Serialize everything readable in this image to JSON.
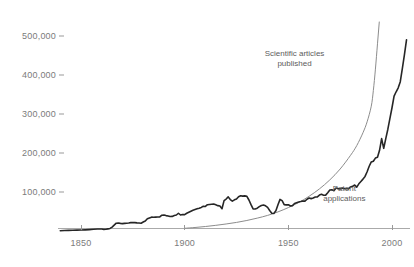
{
  "chart_data": {
    "type": "line",
    "title": "",
    "subtitle": "",
    "xlabel": "",
    "ylabel": "",
    "xlim": [
      1838,
      2008
    ],
    "ylim": [
      0,
      540000
    ],
    "grid": false,
    "legend_position": "inline-annotations",
    "y_ticks": [
      100000,
      200000,
      300000,
      400000,
      500000
    ],
    "y_tick_labels": [
      "100,000",
      "200,000",
      "300,000",
      "400,000",
      "500,000"
    ],
    "x_ticks": [
      1850,
      1900,
      1950,
      2000
    ],
    "x_tick_labels": [
      "1850",
      "1900",
      "1950",
      "2000"
    ],
    "series": [
      {
        "name": "Patent applications",
        "color": "#262626",
        "width": 1.6,
        "style": "jagged",
        "annotation": {
          "lines": [
            "Patent",
            "applications"
          ],
          "x": 1977,
          "y": 95000
        },
        "points": [
          [
            1840,
            800
          ],
          [
            1842,
            1100
          ],
          [
            1844,
            1500
          ],
          [
            1846,
            1800
          ],
          [
            1848,
            2200
          ],
          [
            1850,
            2500
          ],
          [
            1852,
            3000
          ],
          [
            1854,
            3600
          ],
          [
            1856,
            4400
          ],
          [
            1858,
            5200
          ],
          [
            1860,
            5000
          ],
          [
            1861,
            4200
          ],
          [
            1862,
            4500
          ],
          [
            1863,
            5500
          ],
          [
            1864,
            6600
          ],
          [
            1865,
            10000
          ],
          [
            1866,
            15000
          ],
          [
            1867,
            20000
          ],
          [
            1868,
            20500
          ],
          [
            1869,
            19500
          ],
          [
            1870,
            19000
          ],
          [
            1871,
            19500
          ],
          [
            1872,
            20000
          ],
          [
            1873,
            20500
          ],
          [
            1874,
            21500
          ],
          [
            1875,
            21800
          ],
          [
            1876,
            21400
          ],
          [
            1877,
            20800
          ],
          [
            1878,
            20500
          ],
          [
            1879,
            20000
          ],
          [
            1880,
            23000
          ],
          [
            1881,
            25500
          ],
          [
            1882,
            31500
          ],
          [
            1883,
            33500
          ],
          [
            1884,
            35500
          ],
          [
            1885,
            35200
          ],
          [
            1886,
            35500
          ],
          [
            1887,
            35800
          ],
          [
            1888,
            36000
          ],
          [
            1889,
            40500
          ],
          [
            1890,
            41000
          ],
          [
            1891,
            39500
          ],
          [
            1892,
            38500
          ],
          [
            1893,
            37000
          ],
          [
            1894,
            37500
          ],
          [
            1895,
            39500
          ],
          [
            1896,
            41000
          ],
          [
            1897,
            45500
          ],
          [
            1898,
            41000
          ],
          [
            1899,
            42500
          ],
          [
            1900,
            42000
          ],
          [
            1901,
            45500
          ],
          [
            1902,
            48000
          ],
          [
            1903,
            50500
          ],
          [
            1904,
            53000
          ],
          [
            1905,
            55000
          ],
          [
            1906,
            57000
          ],
          [
            1907,
            58500
          ],
          [
            1908,
            60500
          ],
          [
            1909,
            63500
          ],
          [
            1910,
            63000
          ],
          [
            1911,
            67500
          ],
          [
            1912,
            68000
          ],
          [
            1913,
            68500
          ],
          [
            1914,
            69000
          ],
          [
            1915,
            67000
          ],
          [
            1916,
            65000
          ],
          [
            1917,
            64000
          ],
          [
            1918,
            57000
          ],
          [
            1919,
            78000
          ],
          [
            1920,
            82000
          ],
          [
            1921,
            87500
          ],
          [
            1922,
            80500
          ],
          [
            1923,
            76500
          ],
          [
            1924,
            80000
          ],
          [
            1925,
            82000
          ],
          [
            1926,
            88000
          ],
          [
            1927,
            90500
          ],
          [
            1928,
            89500
          ],
          [
            1929,
            90000
          ],
          [
            1930,
            89000
          ],
          [
            1931,
            79500
          ],
          [
            1932,
            67500
          ],
          [
            1933,
            56500
          ],
          [
            1934,
            56500
          ],
          [
            1935,
            58500
          ],
          [
            1936,
            62500
          ],
          [
            1937,
            65500
          ],
          [
            1938,
            66500
          ],
          [
            1939,
            64500
          ],
          [
            1940,
            60500
          ],
          [
            1941,
            52500
          ],
          [
            1942,
            45500
          ],
          [
            1943,
            45000
          ],
          [
            1944,
            52000
          ],
          [
            1945,
            67500
          ],
          [
            1946,
            81000
          ],
          [
            1947,
            78000
          ],
          [
            1948,
            67500
          ],
          [
            1949,
            67000
          ],
          [
            1950,
            67500
          ],
          [
            1951,
            64000
          ],
          [
            1952,
            65000
          ],
          [
            1953,
            70500
          ],
          [
            1954,
            72500
          ],
          [
            1955,
            74500
          ],
          [
            1956,
            75500
          ],
          [
            1957,
            77000
          ],
          [
            1958,
            76500
          ],
          [
            1959,
            81500
          ],
          [
            1960,
            84500
          ],
          [
            1961,
            83000
          ],
          [
            1962,
            84500
          ],
          [
            1963,
            87000
          ],
          [
            1964,
            87500
          ],
          [
            1965,
            92000
          ],
          [
            1966,
            94000
          ],
          [
            1967,
            91500
          ],
          [
            1968,
            92000
          ],
          [
            1969,
            98000
          ],
          [
            1970,
            105000
          ],
          [
            1971,
            105500
          ],
          [
            1972,
            103500
          ],
          [
            1973,
            110000
          ],
          [
            1974,
            108500
          ],
          [
            1975,
            108000
          ],
          [
            1976,
            110000
          ],
          [
            1977,
            108500
          ],
          [
            1978,
            109000
          ],
          [
            1979,
            108000
          ],
          [
            1980,
            113000
          ],
          [
            1981,
            114500
          ],
          [
            1982,
            118000
          ],
          [
            1983,
            112500
          ],
          [
            1984,
            121000
          ],
          [
            1985,
            127000
          ],
          [
            1986,
            133000
          ],
          [
            1987,
            140000
          ],
          [
            1988,
            152000
          ],
          [
            1989,
            166000
          ],
          [
            1990,
            177000
          ],
          [
            1991,
            179000
          ],
          [
            1992,
            187000
          ],
          [
            1993,
            189000
          ],
          [
            1994,
            207000
          ],
          [
            1995,
            237000
          ],
          [
            1996,
            212000
          ],
          [
            1997,
            237000
          ],
          [
            1998,
            261000
          ],
          [
            1999,
            289000
          ],
          [
            2000,
            316000
          ],
          [
            2001,
            346000
          ],
          [
            2002,
            357000
          ],
          [
            2003,
            367000
          ],
          [
            2004,
            383000
          ],
          [
            2005,
            417000
          ],
          [
            2006,
            452000
          ],
          [
            2007,
            490000
          ]
        ]
      },
      {
        "name": "Scientific articles published",
        "color": "#8c8c8c",
        "width": 1.0,
        "style": "smooth",
        "annotation": {
          "lines": [
            "Scientific articles",
            "published"
          ],
          "x": 1953,
          "y": 440000
        },
        "points": [
          [
            1900,
            7000
          ],
          [
            1905,
            9000
          ],
          [
            1910,
            11500
          ],
          [
            1915,
            14500
          ],
          [
            1920,
            18000
          ],
          [
            1925,
            22000
          ],
          [
            1930,
            27000
          ],
          [
            1935,
            33000
          ],
          [
            1940,
            40000
          ],
          [
            1945,
            49000
          ],
          [
            1950,
            60000
          ],
          [
            1955,
            73000
          ],
          [
            1960,
            89000
          ],
          [
            1965,
            108000
          ],
          [
            1970,
            131000
          ],
          [
            1975,
            159000
          ],
          [
            1980,
            194000
          ],
          [
            1983,
            219000
          ],
          [
            1986,
            252000
          ],
          [
            1988,
            280000
          ],
          [
            1990,
            320000
          ],
          [
            1991,
            360000
          ],
          [
            1992,
            415000
          ],
          [
            1993,
            480000
          ],
          [
            1994,
            545000
          ]
        ]
      }
    ]
  },
  "axis": {
    "axis_line_color": "#aaaaaa",
    "tick_color": "#9a9a9a",
    "label_color": "#7b7b7b"
  },
  "background_color": "#ffffff"
}
